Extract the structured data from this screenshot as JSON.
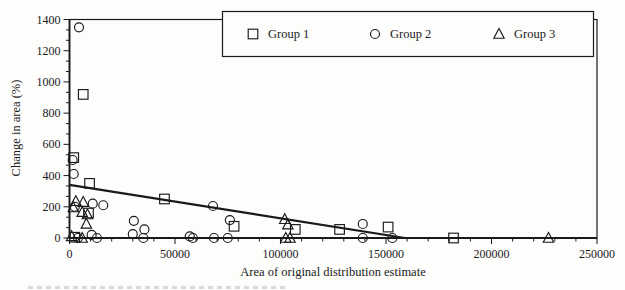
{
  "figure": {
    "background": "#fdfdfb",
    "ink_color": "#1a1a1a"
  },
  "chart_data": {
    "type": "scatter",
    "title": "",
    "xlabel": "Area of original distribution estimate",
    "ylabel": "Change in area (%)",
    "xlim": [
      0,
      250000
    ],
    "ylim": [
      0,
      1400
    ],
    "grid": false,
    "x_major_ticks": [
      0,
      50000,
      100000,
      150000,
      200000,
      250000
    ],
    "x_tick_labels": [
      "0",
      "50000",
      "100000",
      "150000",
      "200000",
      "250000"
    ],
    "x_minor_step": 10000,
    "y_major_ticks": [
      0,
      200,
      400,
      600,
      800,
      1000,
      1200,
      1400
    ],
    "y_tick_labels": [
      "0",
      "200",
      "400",
      "600",
      "800",
      "1000",
      "1200",
      "1400"
    ],
    "y_minors_between_majors": 2,
    "legend": {
      "position": "top-right",
      "items": [
        {
          "marker": "square",
          "label": "Group 1"
        },
        {
          "marker": "circle",
          "label": "Group 2"
        },
        {
          "marker": "triangle",
          "label": "Group 3"
        }
      ]
    },
    "series": [
      {
        "name": "Group 1",
        "marker": "square",
        "points": [
          [
            2000,
            515
          ],
          [
            6500,
            920
          ],
          [
            9500,
            350
          ],
          [
            9000,
            160
          ],
          [
            2500,
            5
          ],
          [
            45000,
            250
          ],
          [
            78000,
            75
          ],
          [
            107000,
            55
          ],
          [
            128000,
            55
          ],
          [
            151000,
            70
          ],
          [
            182000,
            0
          ]
        ]
      },
      {
        "name": "Group 2",
        "marker": "circle",
        "points": [
          [
            4500,
            1350
          ],
          [
            1500,
            500
          ],
          [
            2000,
            410
          ],
          [
            2500,
            200
          ],
          [
            11000,
            220
          ],
          [
            16000,
            210
          ],
          [
            4000,
            0
          ],
          [
            10500,
            20
          ],
          [
            13000,
            0
          ],
          [
            30500,
            110
          ],
          [
            30000,
            25
          ],
          [
            35500,
            55
          ],
          [
            35000,
            0
          ],
          [
            57000,
            10
          ],
          [
            58500,
            0
          ],
          [
            68000,
            205
          ],
          [
            68500,
            0
          ],
          [
            75000,
            0
          ],
          [
            76000,
            115
          ],
          [
            139000,
            90
          ],
          [
            139000,
            0
          ],
          [
            153000,
            0
          ]
        ]
      },
      {
        "name": "Group 3",
        "marker": "triangle",
        "points": [
          [
            3000,
            235
          ],
          [
            6500,
            230
          ],
          [
            1800,
            195
          ],
          [
            6000,
            165
          ],
          [
            8500,
            150
          ],
          [
            8000,
            90
          ],
          [
            1000,
            10
          ],
          [
            6000,
            0
          ],
          [
            102000,
            120
          ],
          [
            103500,
            85
          ],
          [
            102500,
            0
          ],
          [
            104500,
            0
          ],
          [
            227000,
            0
          ]
        ]
      }
    ],
    "trend_line": {
      "x1": 0,
      "y1": 340,
      "x2": 159000,
      "y2": 0
    }
  }
}
